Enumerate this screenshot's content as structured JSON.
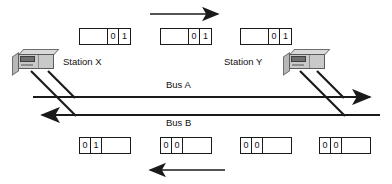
{
  "diagram": {
    "colors": {
      "line": "#1a1a1a",
      "frame_border": "#1a1a1a",
      "station_body": "#c9c9c9",
      "station_panel": "#6f6f6f",
      "background": "#ffffff"
    },
    "stations": [
      {
        "id": "station-x",
        "label": "Station X",
        "x": 12,
        "y": 49
      },
      {
        "id": "station-y",
        "label": "Station Y",
        "x": 283,
        "y": 49
      }
    ],
    "station_labels": [
      {
        "text": "Station X",
        "x": 63,
        "y": 60
      },
      {
        "text": "Station Y",
        "x": 224,
        "y": 60
      }
    ],
    "buses": [
      {
        "id": "bus-a",
        "label": "Bus A",
        "direction": "right",
        "y": 97,
        "label_x": 175,
        "label_y": 84
      },
      {
        "id": "bus-b",
        "label": "Bus B",
        "direction": "left",
        "y": 115,
        "label_x": 175,
        "label_y": 119
      }
    ],
    "flow_arrows": [
      {
        "id": "top-flow-arrow",
        "direction": "right",
        "x1": 150,
        "y1": 14,
        "x2": 224,
        "y2": 14
      },
      {
        "id": "bottom-flow-arrow",
        "direction": "left",
        "x1": 225,
        "y1": 170,
        "x2": 143,
        "y2": 170
      }
    ],
    "top_frames": [
      {
        "id": "top-frame-1",
        "x": 79,
        "y": 28,
        "cells": [
          "",
          "0",
          "1"
        ]
      },
      {
        "id": "top-frame-2",
        "x": 160,
        "y": 28,
        "cells": [
          "",
          "0",
          "1"
        ]
      },
      {
        "id": "top-frame-3",
        "x": 240,
        "y": 28,
        "cells": [
          "",
          "0",
          "1"
        ]
      }
    ],
    "bottom_frames": [
      {
        "id": "bottom-frame-1",
        "x": 79,
        "y": 137,
        "cells": [
          "0",
          "1",
          ""
        ]
      },
      {
        "id": "bottom-frame-2",
        "x": 160,
        "y": 137,
        "cells": [
          "0",
          "0",
          ""
        ]
      },
      {
        "id": "bottom-frame-3",
        "x": 240,
        "y": 137,
        "cells": [
          "0",
          "0",
          ""
        ]
      },
      {
        "id": "bottom-frame-4",
        "x": 319,
        "y": 137,
        "cells": [
          "0",
          "0",
          ""
        ]
      }
    ]
  }
}
